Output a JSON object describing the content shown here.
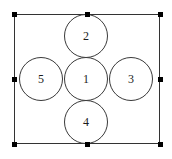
{
  "diagram": {
    "type": "shapes",
    "canvas": {
      "width": 172,
      "height": 159,
      "background": "#ffffff"
    },
    "selection_rect": {
      "x": 14,
      "y": 14,
      "width": 146,
      "height": 130,
      "stroke": "#333333",
      "stroke_width": 1
    },
    "handles": {
      "color": "#000000",
      "size": 5,
      "positions": [
        {
          "name": "top-left",
          "x": 14,
          "y": 14
        },
        {
          "name": "top-center",
          "x": 87,
          "y": 14
        },
        {
          "name": "top-right",
          "x": 160,
          "y": 14
        },
        {
          "name": "middle-left",
          "x": 14,
          "y": 79
        },
        {
          "name": "middle-right",
          "x": 160,
          "y": 79
        },
        {
          "name": "bottom-left",
          "x": 14,
          "y": 144
        },
        {
          "name": "bottom-center",
          "x": 87,
          "y": 144
        },
        {
          "name": "bottom-right",
          "x": 160,
          "y": 144
        }
      ]
    },
    "circles": [
      {
        "label": "1",
        "position": "center",
        "cx": 86,
        "cy": 79,
        "r": 22
      },
      {
        "label": "2",
        "position": "top",
        "cx": 86,
        "cy": 36,
        "r": 22
      },
      {
        "label": "3",
        "position": "right",
        "cx": 131,
        "cy": 79,
        "r": 22
      },
      {
        "label": "4",
        "position": "bottom",
        "cx": 86,
        "cy": 122,
        "r": 22
      },
      {
        "label": "5",
        "position": "left",
        "cx": 41,
        "cy": 79,
        "r": 22
      }
    ],
    "circle_stroke": "#3a3a3a",
    "label_color": "#1c1c1c"
  }
}
